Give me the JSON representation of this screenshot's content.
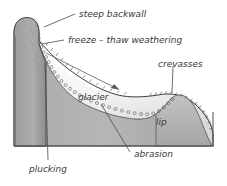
{
  "figure": {
    "background_color": "#ffffff",
    "rock_color": "#b2b2b2",
    "rock_dark_color": "#8f8f8f",
    "ice_color": "#fbfbfb",
    "ice_shade_color": "#dcdcdc",
    "outline_color": "#3c3c3c",
    "label_color": "#3a3a3a"
  },
  "labels": {
    "steep_backwall": "steep backwall",
    "freeze_thaw": "freeze – thaw weathering",
    "crevasses": "crevasses",
    "glacier": "glacier",
    "lip": "lip",
    "abrasion": "abrasion",
    "plucking": "plucking"
  },
  "annotations": {
    "flow_arrow": "ice-flow-direction-arrow",
    "crevasse_ticks": "crevasse-tick-marks",
    "moraine_beads": "beaded-basal-debris-line",
    "ground_line": "ground-baseline"
  },
  "icons": {
    "arrow": "arrow-right-icon"
  }
}
